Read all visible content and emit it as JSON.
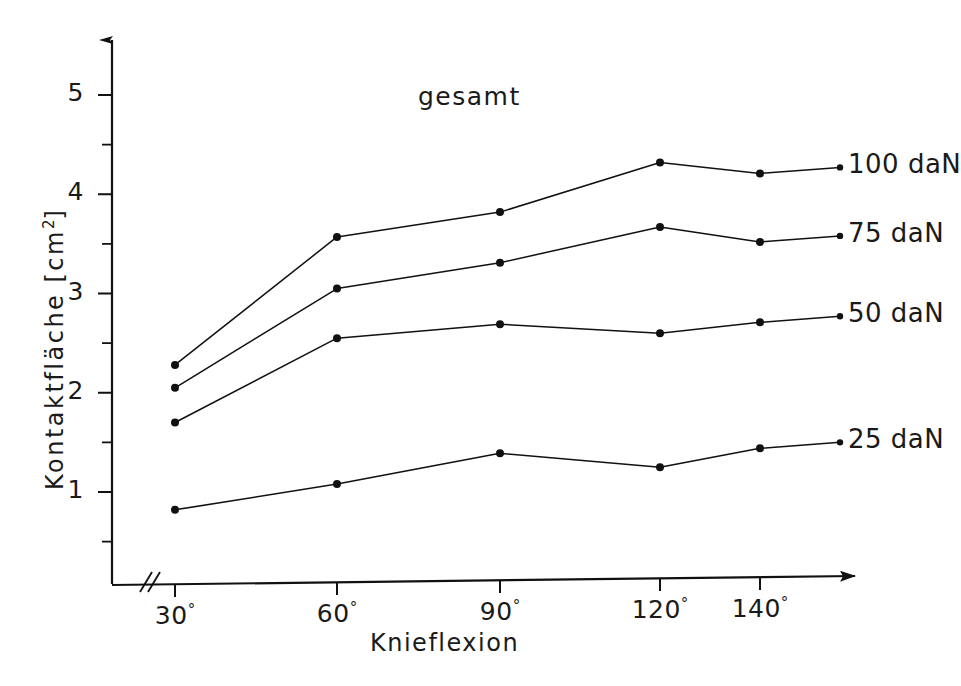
{
  "chart_data": {
    "type": "line",
    "title": "gesamt",
    "xlabel": "Knieflexion",
    "ylabel": "Kontaktfläche [cm2]",
    "ylabel_base": "Kontaktfläche [cm",
    "ylabel_sup": "2",
    "ylabel_tail": "]",
    "categories": [
      "30°",
      "60°",
      "90°",
      "120°",
      "140°"
    ],
    "x_values": [
      30,
      60,
      90,
      120,
      140
    ],
    "xtick_labels": [
      {
        "num": "30",
        "deg": "°"
      },
      {
        "num": "60",
        "deg": "°"
      },
      {
        "num": "90",
        "deg": "°"
      },
      {
        "num": "120",
        "deg": "°"
      },
      {
        "num": "140",
        "deg": "°"
      }
    ],
    "ytick_labels": [
      "5",
      "4",
      "3",
      "2",
      "1"
    ],
    "ytick_values": [
      5,
      4,
      3,
      2,
      1
    ],
    "yminor_values": [
      4.5,
      3.5,
      2.5,
      1.5,
      0.5
    ],
    "ylim": [
      0,
      5.4
    ],
    "grid": false,
    "axis_break": true,
    "legend_position": "right-inline",
    "series": [
      {
        "name": "100 daN",
        "label": "100 daN",
        "color": "#111111",
        "values": [
          2.28,
          3.57,
          3.82,
          4.32,
          4.21
        ]
      },
      {
        "name": "75 daN",
        "label": "75 daN",
        "color": "#111111",
        "values": [
          2.05,
          3.05,
          3.31,
          3.67,
          3.52
        ]
      },
      {
        "name": "50 daN",
        "label": "50 daN",
        "color": "#111111",
        "values": [
          1.7,
          2.55,
          2.69,
          2.6,
          2.71
        ]
      },
      {
        "name": "25 daN",
        "label": "25 daN",
        "color": "#111111",
        "values": [
          0.82,
          1.08,
          1.39,
          1.25,
          1.44
        ]
      }
    ]
  },
  "colors": {
    "ink": "#111111",
    "background": "#ffffff"
  }
}
